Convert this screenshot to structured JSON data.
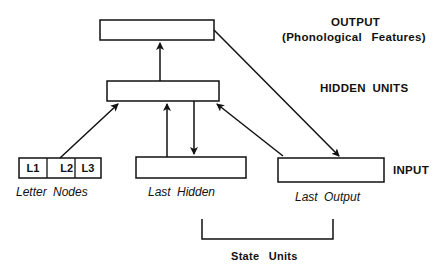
{
  "diagram": {
    "layers": {
      "output": {
        "label": "OUTPUT",
        "sublabel": "(Phonological Features)"
      },
      "hidden": {
        "label": "HIDDEN UNITS"
      },
      "input": {
        "label": "INPUT"
      }
    },
    "input_groups": {
      "letter_nodes": {
        "label": "Letter Nodes",
        "cells": [
          "L1",
          "L2",
          "L3"
        ]
      },
      "last_hidden": {
        "label": "Last Hidden"
      },
      "last_output": {
        "label": "Last Output"
      }
    },
    "bracket_label": "State Units",
    "connections": [
      {
        "from": "letter_nodes",
        "to": "hidden"
      },
      {
        "from": "last_hidden",
        "to": "hidden"
      },
      {
        "from": "hidden",
        "to": "last_hidden"
      },
      {
        "from": "last_output",
        "to": "hidden"
      },
      {
        "from": "hidden",
        "to": "output"
      },
      {
        "from": "output",
        "to": "last_output"
      }
    ]
  }
}
